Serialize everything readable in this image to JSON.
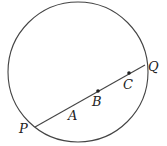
{
  "figure": {
    "circle": {
      "cx": 78,
      "cy": 72,
      "r": 70,
      "stroke": "#444444"
    },
    "chord": {
      "x1": 35,
      "y1": 127,
      "x2": 145,
      "y2": 65,
      "stroke": "#444444"
    },
    "points": {
      "P": {
        "label": "P"
      },
      "Q": {
        "label": "Q"
      },
      "A": {
        "label": "A"
      },
      "B": {
        "label": "B"
      },
      "C": {
        "label": "C"
      }
    }
  }
}
